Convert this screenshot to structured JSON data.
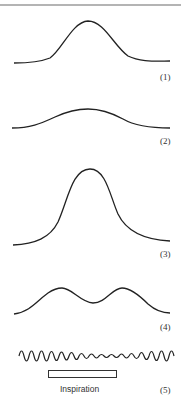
{
  "figure": {
    "panels": [
      {
        "id": 1,
        "label": "(1)",
        "description": "single moderate peak"
      },
      {
        "id": 2,
        "label": "(2)",
        "description": "low broad peak"
      },
      {
        "id": 3,
        "label": "(3)",
        "description": "tall narrow peak"
      },
      {
        "id": 4,
        "label": "(4)",
        "description": "double peak"
      },
      {
        "id": 5,
        "label": "(5)",
        "description": "oscillating trace reduced during inspiration"
      }
    ],
    "inspiration_label": "Inspiration",
    "stroke_color": "#222222",
    "topline_color": "#b4b4b4"
  }
}
